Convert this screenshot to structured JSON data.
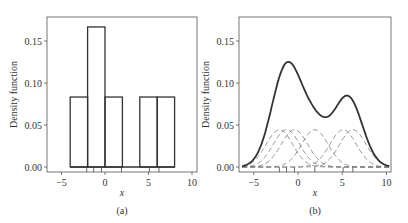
{
  "chart_data": [
    {
      "type": "bar",
      "panel_label": "(a)",
      "xlabel": "x",
      "ylabel": "Density function",
      "xlim": [
        -6.5,
        10.5
      ],
      "ylim": [
        -0.008,
        0.178
      ],
      "xticks": [
        -5,
        0,
        5,
        10
      ],
      "yticks": [
        0.0,
        0.05,
        0.1,
        0.15
      ],
      "ytick_labels": [
        "0.00",
        "0.05",
        "0.10",
        "0.15"
      ],
      "xtick_labels": [
        "−5",
        "0",
        "5",
        "10"
      ],
      "bins": [
        [
          -4,
          -2
        ],
        [
          -2,
          0
        ],
        [
          0,
          2
        ],
        [
          2,
          4
        ],
        [
          4,
          6
        ],
        [
          6,
          8
        ]
      ],
      "values": [
        0.0833,
        0.1667,
        0.0833,
        0.0,
        0.0833,
        0.0833
      ],
      "rug": [
        -2.1,
        -1.3,
        -0.4,
        1.9,
        5.1,
        6.2
      ],
      "grid": false
    },
    {
      "type": "line",
      "panel_label": "(b)",
      "xlabel": "x",
      "ylabel": "Density function",
      "xlim": [
        -6.5,
        10.5
      ],
      "ylim": [
        -0.008,
        0.178
      ],
      "xticks": [
        -5,
        0,
        5,
        10
      ],
      "yticks": [
        0.0,
        0.05,
        0.1,
        0.15
      ],
      "ytick_labels": [
        "0.00",
        "0.05",
        "0.10",
        "0.15"
      ],
      "xtick_labels": [
        "−5",
        "0",
        "5",
        "10"
      ],
      "rug": [
        -2.1,
        -1.3,
        -0.4,
        1.9,
        5.1,
        6.2
      ],
      "kernel_bandwidth": 1.5,
      "series": [
        {
          "name": "kernel density estimate",
          "style": "solid",
          "peaks": [
            {
              "x": -1.0,
              "y": 0.126
            },
            {
              "x": 5.6,
              "y": 0.085
            }
          ],
          "trough": {
            "x": 3.0,
            "y": 0.06
          }
        },
        {
          "name": "individual kernels",
          "style": "dashed",
          "centers": [
            -2.1,
            -1.3,
            -0.4,
            1.9,
            5.1,
            6.2
          ],
          "peak_height": 0.044
        }
      ],
      "grid": false
    }
  ]
}
